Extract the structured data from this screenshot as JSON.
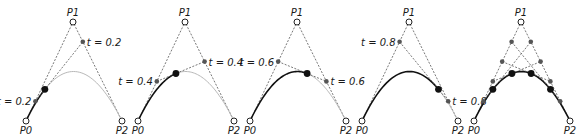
{
  "diagram": {
    "colors": {
      "curve_drawn": "#111111",
      "curve_remaining": "#b8b8b8",
      "control_lines": "#555555",
      "intermediate_point": "#555555",
      "curve_point": "#111111",
      "control_point_fill": "#ffffff"
    },
    "control_points": {
      "p0": {
        "label": "P0",
        "x": 0,
        "y": 99
      },
      "p1": {
        "label": "P1",
        "x": 47,
        "y": 0
      },
      "p2": {
        "label": "P2",
        "x": 96,
        "y": 99
      }
    },
    "panels": [
      {
        "offset_x": 26,
        "t": 0.2,
        "labels": [
          "t = 0.2",
          "t = 0.2"
        ]
      },
      {
        "offset_x": 138,
        "t": 0.4,
        "labels": [
          "t = 0.4",
          "t = 0.4"
        ]
      },
      {
        "offset_x": 250,
        "t": 0.6,
        "labels": [
          "t = 0.6",
          "t = 0.6"
        ]
      },
      {
        "offset_x": 362,
        "t": 0.8,
        "labels": [
          "t = 0.8",
          "t = 0.8"
        ]
      },
      {
        "offset_x": 474,
        "t_list": [
          0.2,
          0.4,
          0.6,
          0.8
        ],
        "labels": []
      }
    ],
    "offset_y": 22
  }
}
